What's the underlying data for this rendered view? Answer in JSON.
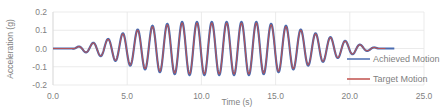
{
  "chart_data": {
    "type": "line",
    "title": "",
    "xlabel": "Time (s)",
    "ylabel": "Acceleration (g)",
    "xlim": [
      0,
      25
    ],
    "ylim": [
      -0.2,
      0.2
    ],
    "x_ticks": [
      "0.0",
      "5.0",
      "10.0",
      "15.0",
      "20.0",
      "25.0"
    ],
    "y_ticks": [
      "0.2",
      "0.1",
      "0.0",
      "-0.1",
      "-0.2"
    ],
    "grid": true,
    "legend_position": "lower right inside",
    "signal": {
      "frequency_hz": 1.0,
      "start_s": 1.3,
      "end_s": 22.0,
      "line_end_s": 23.0,
      "envelope_peaks": [
        {
          "t": 1.7,
          "amp": 0.01
        },
        {
          "t": 2.7,
          "amp": 0.03
        },
        {
          "t": 3.7,
          "amp": 0.05
        },
        {
          "t": 4.7,
          "amp": 0.08
        },
        {
          "t": 5.7,
          "amp": 0.1
        },
        {
          "t": 6.7,
          "amp": 0.12
        },
        {
          "t": 7.7,
          "amp": 0.13
        },
        {
          "t": 8.7,
          "amp": 0.14
        },
        {
          "t": 9.7,
          "amp": 0.14
        },
        {
          "t": 10.7,
          "amp": 0.14
        },
        {
          "t": 11.7,
          "amp": 0.14
        },
        {
          "t": 12.7,
          "amp": 0.14
        },
        {
          "t": 13.7,
          "amp": 0.14
        },
        {
          "t": 14.7,
          "amp": 0.13
        },
        {
          "t": 15.7,
          "amp": 0.12
        },
        {
          "t": 16.7,
          "amp": 0.1
        },
        {
          "t": 17.7,
          "amp": 0.08
        },
        {
          "t": 18.7,
          "amp": 0.06
        },
        {
          "t": 19.7,
          "amp": 0.04
        },
        {
          "t": 20.7,
          "amp": 0.02
        },
        {
          "t": 21.7,
          "amp": 0.005
        }
      ]
    },
    "series": [
      {
        "name": "Achieved Motion",
        "color": "#4472c4",
        "note": "slightly overshoots target at troughs"
      },
      {
        "name": "Target Motion",
        "color": "#c0504d"
      }
    ]
  },
  "legend": {
    "achieved_label": "Achieved Motion",
    "target_label": "Target Motion"
  },
  "axes": {
    "xlabel": "Time (s)",
    "ylabel": "Acceleration (g)"
  },
  "colors": {
    "achieved": "#4a6bb0",
    "target": "#c0504d",
    "grid": "#e6e6e6",
    "text": "#7f7f7f"
  }
}
